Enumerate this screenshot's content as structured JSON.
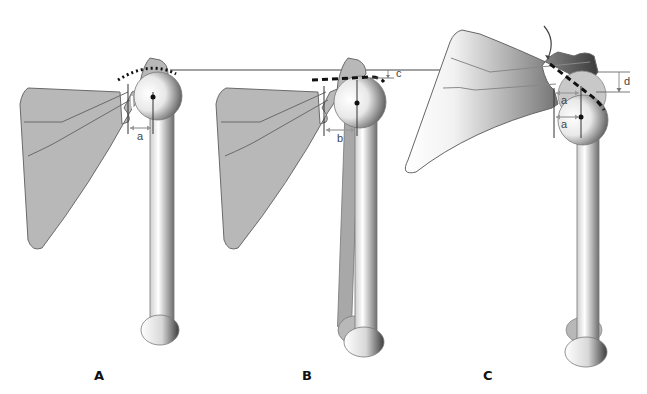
{
  "figure": {
    "reference_line": "horizontal line through acromion top",
    "colors": {
      "bone_fill": "#b8b8b8",
      "outline": "#555555",
      "marker": "#111111",
      "arrow": "#888888",
      "background": "#ffffff"
    }
  },
  "panels": [
    {
      "id": "A",
      "label": "A",
      "measurements": [
        {
          "label": "a",
          "type": "horizontal distance glenoid to humeral head center"
        }
      ],
      "arc_style": "dotted"
    },
    {
      "id": "B",
      "label": "B",
      "measurements": [
        {
          "label": "b",
          "type": "horizontal distance glenoid to humeral head center"
        },
        {
          "label": "c",
          "type": "vertical drop from reference line"
        }
      ],
      "arc_style": "dashed"
    },
    {
      "id": "C",
      "label": "C",
      "measurements": [
        {
          "label": "a",
          "type": "horizontal distance (upper)"
        },
        {
          "label": "a",
          "type": "horizontal distance (lower)"
        },
        {
          "label": "d",
          "type": "vertical drop from reference line"
        }
      ],
      "arc_style": "dashed",
      "rotation_arrow": true
    }
  ]
}
